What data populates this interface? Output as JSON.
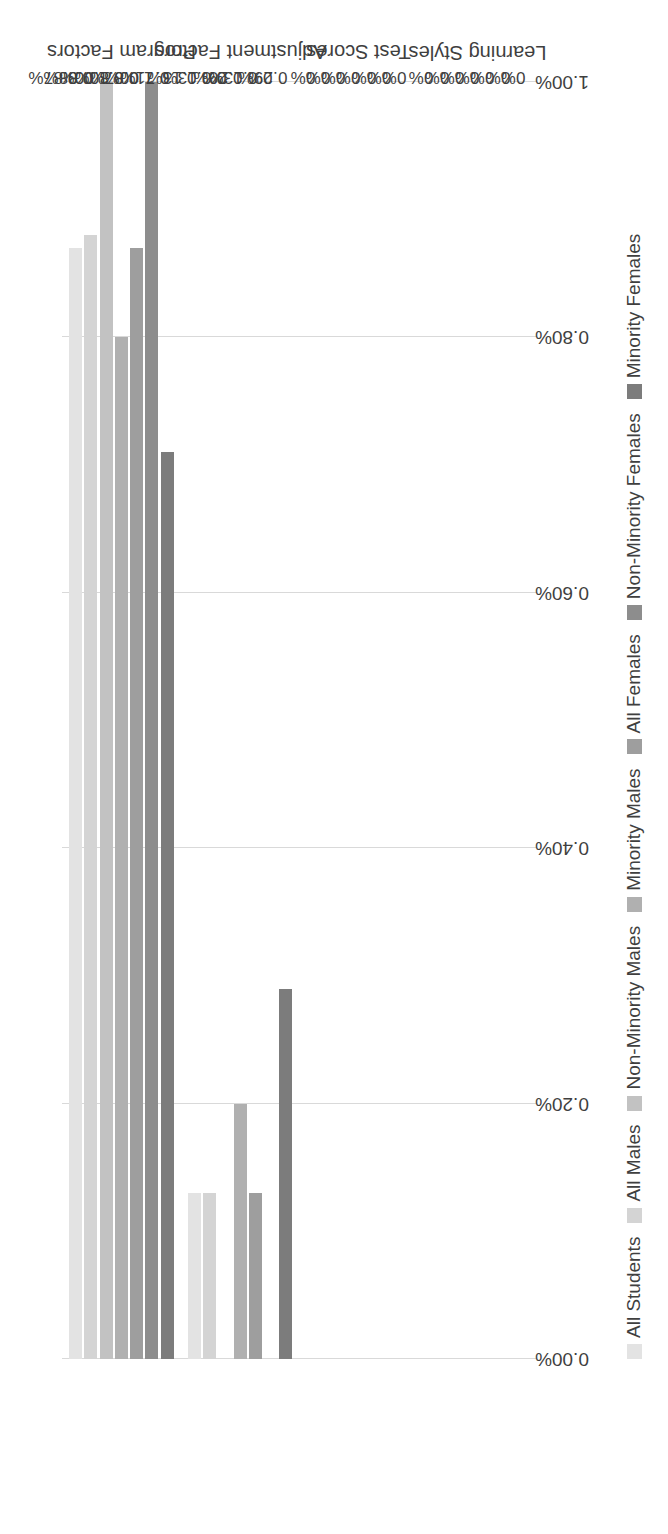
{
  "chart_data": {
    "type": "bar",
    "orientation": "horizontal",
    "title": "",
    "subtitle": "",
    "xlabel": "",
    "ylabel": "",
    "xlim": [
      0,
      1.0
    ],
    "grid": true,
    "legend_position": "bottom",
    "axis_ticks": [
      "0.00%",
      "0.20%",
      "0.40%",
      "0.60%",
      "0.80%",
      "1.00%"
    ],
    "axis_tick_values": [
      0,
      0.2,
      0.4,
      0.6,
      0.8,
      1.0
    ],
    "categories": [
      "Program Factors",
      "Adjustment Factors",
      "Test Scores",
      "Learning Styles"
    ],
    "series": [
      {
        "name": "All Students",
        "color": "#e3e3e3",
        "values": [
          0.87,
          0.13,
          0,
          0
        ],
        "labels": [
          "0.87%",
          "0.13%",
          "0%",
          "0%"
        ]
      },
      {
        "name": "All Males",
        "color": "#d4d4d4",
        "values": [
          0.88,
          0.13,
          0,
          0
        ],
        "labels": [
          "0.88%",
          "0.13%",
          "0%",
          "0%"
        ]
      },
      {
        "name": "Non-Minority Males",
        "color": "#c2c2c2",
        "values": [
          1.0,
          0,
          0,
          0
        ],
        "labels": [
          "1.00%",
          "0%",
          "0%",
          "0%"
        ]
      },
      {
        "name": "Minority Males",
        "color": "#b0b0b0",
        "values": [
          0.8,
          0.2,
          0,
          0
        ],
        "labels": [
          "0.80%",
          "0.20%",
          "0%",
          "0%"
        ]
      },
      {
        "name": "All Females",
        "color": "#9e9e9e",
        "values": [
          0.87,
          0.13,
          0,
          0
        ],
        "labels": [
          "0.87%",
          "0.13%",
          "0%",
          "0%"
        ]
      },
      {
        "name": "Non-Minority Females",
        "color": "#8d8d8d",
        "values": [
          1.0,
          0,
          0,
          0
        ],
        "labels": [
          "1.00%",
          "0%",
          "0%",
          "0%"
        ]
      },
      {
        "name": "Minority Females",
        "color": "#7c7c7c",
        "values": [
          0.71,
          0.29,
          0,
          0
        ],
        "labels": [
          "0.71%",
          "0.29%",
          "0%",
          "0%"
        ]
      }
    ]
  },
  "style": {
    "gridline_color": "#d9d9d9",
    "text_color": "#3f3f3f",
    "background": "#ffffff"
  }
}
